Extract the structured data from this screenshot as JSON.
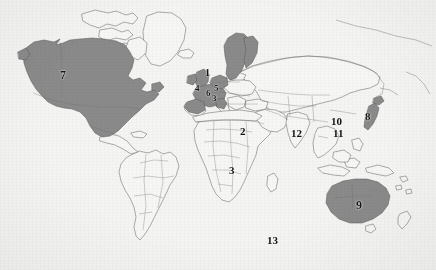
{
  "figure": {
    "kind": "world-map",
    "caption": "",
    "background_color": "#f4f4f2",
    "shaded_color": "#8a8a8a",
    "unshaded_color": "#f6f6f4",
    "outline_color": "#6b6b6b",
    "label_color": "#141414"
  },
  "labels": [
    {
      "id": "1",
      "text": "1",
      "x": 205,
      "y": 73,
      "size": 10,
      "region": "united-kingdom"
    },
    {
      "id": "4",
      "text": "4",
      "x": 196,
      "y": 88,
      "size": 9,
      "region": "ireland-west-europe"
    },
    {
      "id": "6",
      "text": "6",
      "x": 207,
      "y": 93,
      "size": 9,
      "region": "netherlands-belgium"
    },
    {
      "id": "5",
      "text": "5",
      "x": 215,
      "y": 88,
      "size": 9,
      "region": "denmark-germany"
    },
    {
      "id": "3b",
      "text": "3",
      "x": 213,
      "y": 98,
      "size": 9,
      "region": "central-europe"
    },
    {
      "id": "2",
      "text": "2",
      "x": 242,
      "y": 132,
      "size": 11,
      "region": "north-africa"
    },
    {
      "id": "3",
      "text": "3",
      "x": 231,
      "y": 171,
      "size": 11,
      "region": "central-africa"
    },
    {
      "id": "7",
      "text": "7",
      "x": 63,
      "y": 76,
      "size": 12,
      "region": "north-america"
    },
    {
      "id": "12",
      "text": "12",
      "x": 296,
      "y": 134,
      "size": 11,
      "region": "india"
    },
    {
      "id": "10",
      "text": "10",
      "x": 337,
      "y": 122,
      "size": 11,
      "region": "china-north"
    },
    {
      "id": "11",
      "text": "11",
      "x": 338,
      "y": 134,
      "size": 11,
      "region": "china-south"
    },
    {
      "id": "8",
      "text": "8",
      "x": 368,
      "y": 117,
      "size": 11,
      "region": "japan"
    },
    {
      "id": "9",
      "text": "9",
      "x": 359,
      "y": 205,
      "size": 12,
      "region": "australia"
    },
    {
      "id": "13",
      "text": "13",
      "x": 272,
      "y": 241,
      "size": 11,
      "region": "southern-ocean"
    }
  ],
  "shaded_regions": [
    {
      "name": "north-america",
      "label": "United States and Canada"
    },
    {
      "name": "western-europe",
      "label": "Western Europe"
    },
    {
      "name": "scandinavia",
      "label": "Norway and Sweden"
    },
    {
      "name": "japan",
      "label": "Japan"
    },
    {
      "name": "australia",
      "label": "Australia"
    }
  ],
  "unshaded_regions": [
    {
      "name": "greenland",
      "label": "Greenland"
    },
    {
      "name": "south-america",
      "label": "South America"
    },
    {
      "name": "russia",
      "label": "Russia and Northern Asia"
    },
    {
      "name": "africa",
      "label": "Africa"
    },
    {
      "name": "south-asia",
      "label": "South and Southeast Asia"
    }
  ]
}
